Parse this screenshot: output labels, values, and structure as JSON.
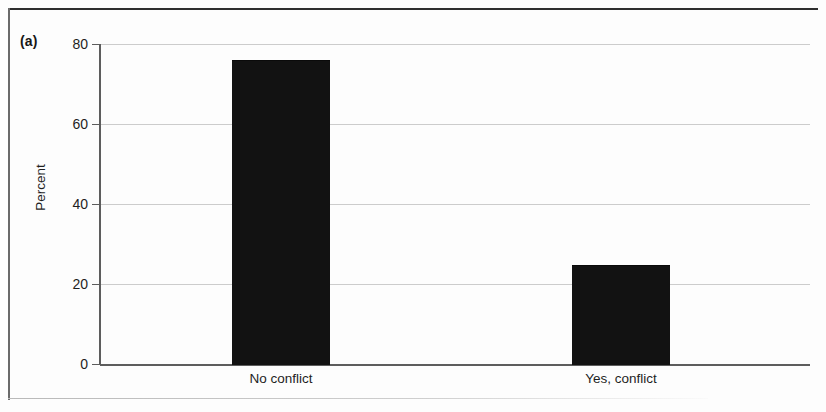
{
  "figure": {
    "panel_label": "(a)"
  },
  "chart_data": {
    "type": "bar",
    "title": "",
    "subtitle": "",
    "panel": "(a)",
    "categories": [
      "No conflict",
      "Yes, conflict"
    ],
    "values": [
      76,
      24.8
    ],
    "series": [
      {
        "name": "Percent",
        "values": [
          76,
          24.8
        ]
      }
    ],
    "xlabel": "",
    "ylabel": "Percent",
    "ylim": [
      0,
      80
    ],
    "yticks": [
      0,
      20,
      40,
      60,
      80
    ],
    "ytick_labels": [
      "0",
      "20",
      "40",
      "60",
      "80"
    ],
    "grid": "horizontal",
    "legend": "none",
    "bar_color": "#121212",
    "gridline_color": "#cccccc",
    "axis_color": "#5d5d5d"
  }
}
